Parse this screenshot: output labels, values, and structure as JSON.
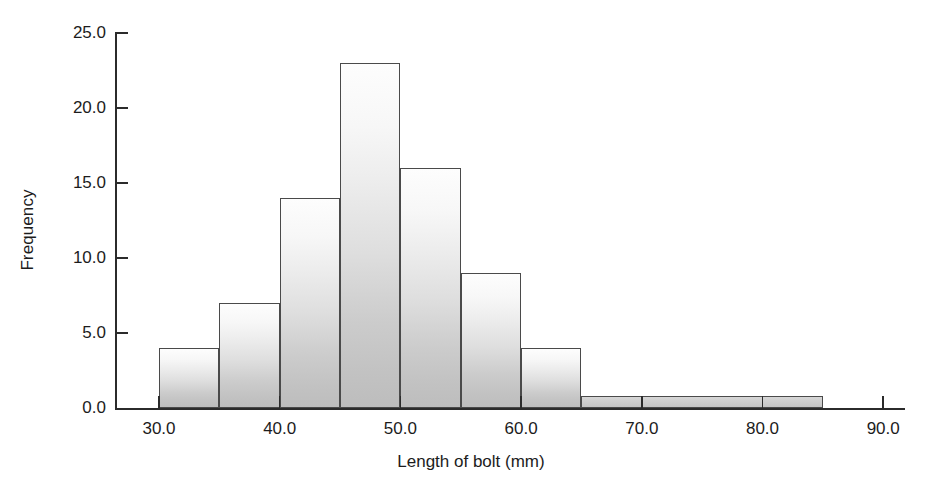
{
  "chart_data": {
    "type": "bar",
    "title": "",
    "subtitle": "",
    "xlabel": "Length of bolt (mm)",
    "ylabel": "Frequency",
    "xlim": [
      27.5,
      90.0
    ],
    "ylim": [
      0.0,
      25.0
    ],
    "grid": false,
    "legend": null,
    "x_tick_labels": [
      "30.0",
      "40.0",
      "50.0",
      "60.0",
      "70.0",
      "80.0",
      "90.0"
    ],
    "x_ticks": [
      30,
      40,
      50,
      60,
      70,
      80,
      90
    ],
    "y_tick_labels": [
      "0.0",
      "5.0",
      "10.0",
      "15.0",
      "20.0",
      "25.0"
    ],
    "y_ticks": [
      0,
      5,
      10,
      15,
      20,
      25
    ],
    "bin_edges": [
      30,
      35,
      40,
      45,
      50,
      55,
      60,
      65,
      85
    ],
    "categories": [
      "30-35",
      "35-40",
      "40-45",
      "45-50",
      "50-55",
      "55-60",
      "60-65",
      "65-85"
    ],
    "values": [
      4,
      7,
      14,
      23,
      16,
      9,
      4,
      0.8
    ],
    "bars": [
      {
        "label": "30-35",
        "start": 30,
        "end": 35,
        "value": 4
      },
      {
        "label": "35-40",
        "start": 35,
        "end": 40,
        "value": 7
      },
      {
        "label": "40-45",
        "start": 40,
        "end": 45,
        "value": 14
      },
      {
        "label": "45-50",
        "start": 45,
        "end": 50,
        "value": 23
      },
      {
        "label": "50-55",
        "start": 50,
        "end": 55,
        "value": 16
      },
      {
        "label": "55-60",
        "start": 55,
        "end": 60,
        "value": 9
      },
      {
        "label": "60-65",
        "start": 60,
        "end": 65,
        "value": 4
      },
      {
        "label": "65-85",
        "start": 65,
        "end": 85,
        "value": 0.8
      }
    ],
    "colors": {
      "bar_fill_top": "#fdfdfd",
      "bar_fill_bottom": "#bdbdbd",
      "bar_stroke": "#4a4a4a",
      "axis": "#2b2b2b",
      "text": "#1c1c1c",
      "background": "#ffffff"
    }
  }
}
